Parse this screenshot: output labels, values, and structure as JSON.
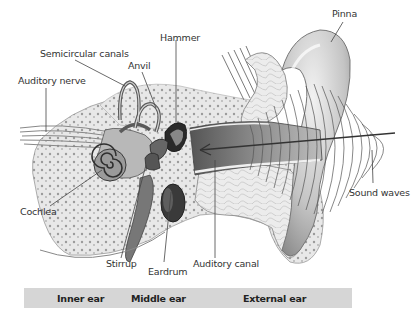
{
  "diagram": {
    "labels": {
      "pinna": "Pinna",
      "hammer": "Hammer",
      "semicircular_canals": "Semicircular canals",
      "anvil": "Anvil",
      "auditory_nerve": "Auditory nerve",
      "cochlea": "Cochlea",
      "stirrup": "Stirrup",
      "eardrum": "Eardrum",
      "auditory_canal": "Auditory canal",
      "sound_waves": "Sound waves"
    },
    "regions": {
      "inner_ear": "Inner ear",
      "middle_ear": "Middle ear",
      "external_ear": "External ear"
    },
    "colors": {
      "band": "#d6d6d6",
      "line": "#333333",
      "tissue_light": "#e6e6e6",
      "tissue_mid": "#a8a8a8",
      "tissue_dark": "#4a4a4a"
    }
  }
}
